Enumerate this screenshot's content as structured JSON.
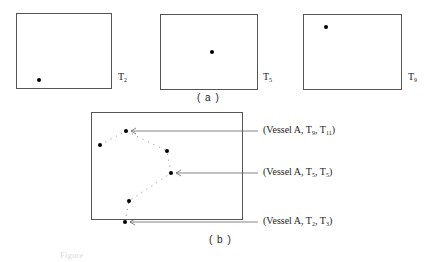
{
  "panel_a": {
    "caption": "( a )",
    "frames": [
      {
        "label_main": "T",
        "label_sub": "2",
        "box": {
          "x": 16,
          "y": 13,
          "w": 96,
          "h": 76
        },
        "dot": {
          "x": 39,
          "y": 80
        }
      },
      {
        "label_main": "T",
        "label_sub": "5",
        "box": {
          "x": 160,
          "y": 14,
          "w": 98,
          "h": 76
        },
        "dot": {
          "x": 212,
          "y": 52
        }
      },
      {
        "label_main": "T",
        "label_sub": "9",
        "box": {
          "x": 303,
          "y": 14,
          "w": 99,
          "h": 76
        },
        "dot": {
          "x": 326,
          "y": 27
        }
      }
    ]
  },
  "panel_b": {
    "caption": "( b )",
    "box": {
      "x": 91,
      "y": 112,
      "w": 152,
      "h": 108
    },
    "trajectory_points": [
      {
        "x": 126,
        "y": 131
      },
      {
        "x": 100,
        "y": 145
      },
      {
        "x": 167,
        "y": 151
      },
      {
        "x": 171,
        "y": 173
      },
      {
        "x": 129,
        "y": 201
      },
      {
        "x": 125,
        "y": 222
      }
    ],
    "annotations": [
      {
        "prefix": "(Vessel A, T",
        "sub1": "9",
        "mid": ", T",
        "sub2": "11",
        "suffix": ")",
        "point": {
          "x": 126,
          "y": 131
        },
        "label_y": 131
      },
      {
        "prefix": "(Vessel A, T",
        "sub1": "5",
        "mid": ", T",
        "sub2": "5",
        "suffix": ")",
        "point": {
          "x": 171,
          "y": 173
        },
        "label_y": 173
      },
      {
        "prefix": "(Vessel A, T",
        "sub1": "2",
        "mid": ", T",
        "sub2": "3",
        "suffix": ")",
        "point": {
          "x": 125,
          "y": 222
        },
        "label_y": 222
      }
    ]
  },
  "figure_caption": "Figure"
}
